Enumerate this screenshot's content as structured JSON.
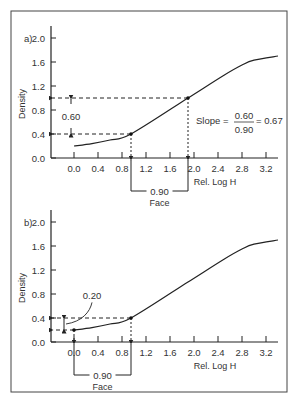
{
  "chart_data": [
    {
      "type": "line",
      "panel_label": "a)",
      "xlabel": "Rel. Log H",
      "ylabel": "Density",
      "x_ticks": [
        "0.0",
        "0.4",
        "0.8",
        "1.2",
        "1.6",
        "2.0",
        "2.4",
        "2.8",
        "3.2"
      ],
      "y_ticks": [
        "0.0",
        "0.4",
        "0.8",
        "1.2",
        "1.6",
        "2.0"
      ],
      "xlim": [
        -0.35,
        3.4
      ],
      "ylim": [
        0.0,
        2.0
      ],
      "grid": false,
      "series": [
        {
          "name": "characteristic curve",
          "x": [
            0.0,
            0.3,
            0.6,
            0.95,
            1.9,
            2.5,
            2.8,
            3.0,
            3.4
          ],
          "y": [
            0.2,
            0.24,
            0.3,
            0.4,
            1.0,
            1.38,
            1.55,
            1.63,
            1.7
          ]
        }
      ],
      "marked_points": [
        {
          "x": 0.95,
          "y": 0.4
        },
        {
          "x": 1.9,
          "y": 1.0
        }
      ],
      "annotations": {
        "density_difference": "0.60",
        "logh_difference": "0.90",
        "face_label": "Face",
        "slope_label": "Slope =",
        "slope_numerator": "0.60",
        "slope_denominator": "0.90",
        "slope_result": "= 0.67"
      }
    },
    {
      "type": "line",
      "panel_label": "b)",
      "xlabel": "Rel. Log H",
      "ylabel": "Density",
      "x_ticks": [
        "0.0",
        "0.4",
        "0.8",
        "1.2",
        "1.6",
        "2.0",
        "2.4",
        "2.8",
        "3.2"
      ],
      "y_ticks": [
        "0.0",
        "0.4",
        "0.8",
        "1.2",
        "1.6",
        "2.0"
      ],
      "xlim": [
        -0.35,
        3.4
      ],
      "ylim": [
        0.0,
        2.0
      ],
      "grid": false,
      "series": [
        {
          "name": "characteristic curve",
          "x": [
            0.0,
            0.3,
            0.6,
            0.95,
            1.9,
            2.5,
            2.8,
            3.0,
            3.4
          ],
          "y": [
            0.2,
            0.24,
            0.3,
            0.4,
            1.0,
            1.38,
            1.55,
            1.63,
            1.7
          ]
        }
      ],
      "marked_points": [
        {
          "x": 0.0,
          "y": 0.2
        },
        {
          "x": 0.95,
          "y": 0.4
        }
      ],
      "annotations": {
        "density_difference": "0.20",
        "logh_difference": "0.90",
        "face_label": "Face"
      }
    }
  ]
}
